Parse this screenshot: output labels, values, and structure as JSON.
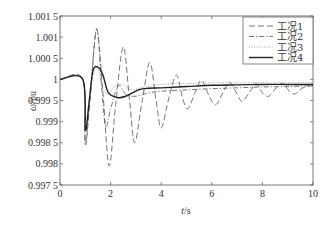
{
  "chart_data": {
    "type": "line",
    "title": "",
    "xlabel": "t/s",
    "xlabel_parts": {
      "var": "t",
      "unit": "/s"
    },
    "ylabel": "ω/pu",
    "ylabel_parts": {
      "var": "ω",
      "unit": "/pu"
    },
    "xlim": [
      0,
      10
    ],
    "ylim": [
      0.9975,
      1.0015
    ],
    "x_ticks": [
      0,
      2,
      4,
      6,
      8,
      10
    ],
    "x_tick_labels": [
      "0",
      "2",
      "4",
      "6",
      "8",
      "10"
    ],
    "y_ticks": [
      0.9975,
      0.998,
      0.9985,
      0.999,
      0.9995,
      1.0,
      1.0005,
      1.001,
      1.0015
    ],
    "y_tick_labels": [
      "0.997 5",
      "0.998",
      "0.998 5",
      "0.999",
      "0.999 5",
      "1",
      "1.000 5",
      "1.001",
      "1.001 5"
    ],
    "grid": false,
    "legend_position": "upper right",
    "series": [
      {
        "name": "工况1",
        "style": "dashed",
        "x": [
          0,
          0.9,
          1.0,
          1.2,
          1.45,
          1.7,
          1.94,
          2.2,
          2.5,
          2.75,
          2.95,
          3.25,
          3.55,
          3.8,
          4.0,
          4.3,
          4.6,
          4.85,
          5.05,
          5.35,
          5.6,
          5.9,
          6.15,
          6.45,
          6.7,
          7.0,
          7.2,
          7.5,
          7.75,
          8.0,
          8.25,
          8.55,
          8.8,
          9.1,
          9.3,
          9.6,
          10.0
        ],
        "y": [
          1.0,
          1.0,
          0.99845,
          0.9996,
          1.00118,
          0.99965,
          0.99795,
          0.9994,
          1.00077,
          0.9995,
          0.9985,
          0.9995,
          1.0004,
          0.9995,
          0.99885,
          0.99955,
          1.0001,
          0.99955,
          0.9993,
          0.9997,
          0.99998,
          0.9996,
          0.9994,
          0.9997,
          0.99993,
          0.99965,
          0.99948,
          0.9997,
          0.9999,
          0.99968,
          0.9996,
          0.9998,
          0.9999,
          0.9997,
          0.99966,
          0.9998,
          0.99985
        ]
      },
      {
        "name": "工况2",
        "style": "dash-dot",
        "x": [
          0,
          0.9,
          1.0,
          1.2,
          1.45,
          1.65,
          1.8,
          2.0,
          2.3,
          2.6,
          3.0,
          3.5,
          4.0,
          5.0,
          6.0,
          7.0,
          8.0,
          9.0,
          10.0
        ],
        "y": [
          1.0,
          1.0,
          0.99848,
          0.9997,
          1.0012,
          0.9998,
          0.99888,
          0.9993,
          0.99985,
          0.99965,
          0.9996,
          0.99968,
          0.99972,
          0.99975,
          0.99978,
          0.9998,
          0.99982,
          0.99983,
          0.99985
        ]
      },
      {
        "name": "工况3",
        "style": "dotted",
        "x": [
          0,
          0.9,
          1.0,
          1.2,
          1.45,
          1.7,
          1.9,
          2.1,
          2.45,
          2.8,
          3.2,
          4.0,
          5.0,
          6.0,
          7.0,
          8.0,
          9.0,
          10.0
        ],
        "y": [
          1.0,
          1.0,
          0.9988,
          0.9998,
          1.0003,
          0.9998,
          0.99965,
          0.9998,
          0.99988,
          0.99975,
          0.9998,
          0.99988,
          0.9999,
          0.99992,
          0.99992,
          0.99992,
          0.99992,
          0.99992
        ]
      },
      {
        "name": "工况4",
        "style": "solid",
        "x": [
          0,
          0.9,
          1.0,
          1.15,
          1.3,
          1.5,
          1.7,
          1.9,
          2.25,
          2.6,
          3.1,
          3.5,
          4.0,
          5.0,
          6.0,
          7.0,
          8.0,
          9.0,
          10.0
        ],
        "y": [
          1.0,
          1.0,
          0.9988,
          0.99945,
          1.0002,
          1.00029,
          1.0001,
          0.9997,
          0.99957,
          0.9996,
          0.99975,
          0.99979,
          0.9998,
          0.99983,
          0.99986,
          0.99987,
          0.99988,
          0.99988,
          0.99988
        ]
      }
    ]
  },
  "legend": {
    "items": [
      {
        "label": "工况1",
        "style": "dashed"
      },
      {
        "label": "工况2",
        "style": "dash-dot"
      },
      {
        "label": "工况3",
        "style": "dotted"
      },
      {
        "label": "工况4",
        "style": "solid"
      }
    ]
  },
  "colors": {
    "axis": "#555555",
    "line": "#222222",
    "light_line": "#666666"
  }
}
